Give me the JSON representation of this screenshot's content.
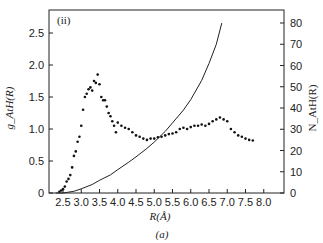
{
  "chart_data": {
    "type": "scatter",
    "panel_label": "(ii)",
    "caption": "(a)",
    "xlabel": "R(Å)",
    "ylabel_left": "g_AtH(R)",
    "ylabel_right": "N_AtH(R)",
    "xlim": [
      2.1,
      8.1
    ],
    "ylim_left": [
      0,
      2.85
    ],
    "ylim_right": [
      0,
      80
    ],
    "x_ticks": [
      "2.5",
      "3.0",
      "3.5",
      "4.0",
      "4.5",
      "5.0",
      "5.5",
      "6.0",
      "6.5",
      "7.0",
      "7.5",
      "8.0"
    ],
    "y_ticks_left": [
      "0",
      "0.5",
      "1.0",
      "1.5",
      "2.0",
      "2.5"
    ],
    "y_ticks_right": [
      "0",
      "10",
      "20",
      "30",
      "40",
      "50",
      "60",
      "70",
      "80"
    ],
    "series": [
      {
        "name": "g_AtH(R)",
        "style": "points",
        "axis": "left",
        "x": [
          2.4,
          2.45,
          2.5,
          2.55,
          2.6,
          2.65,
          2.7,
          2.75,
          2.8,
          2.85,
          2.9,
          2.95,
          3.0,
          3.05,
          3.1,
          3.15,
          3.2,
          3.25,
          3.3,
          3.35,
          3.4,
          3.45,
          3.5,
          3.55,
          3.6,
          3.65,
          3.7,
          3.75,
          3.8,
          3.85,
          3.9,
          3.95,
          4.0,
          4.1,
          4.2,
          4.3,
          4.4,
          4.5,
          4.6,
          4.7,
          4.8,
          4.9,
          5.0,
          5.1,
          5.2,
          5.3,
          5.4,
          5.5,
          5.6,
          5.7,
          5.8,
          5.9,
          6.0,
          6.1,
          6.2,
          6.3,
          6.4,
          6.5,
          6.6,
          6.7,
          6.8,
          6.9,
          7.0,
          7.1,
          7.2,
          7.3,
          7.4,
          7.5,
          7.6,
          7.7
        ],
        "y": [
          0.02,
          0.04,
          0.06,
          0.1,
          0.18,
          0.22,
          0.28,
          0.4,
          0.58,
          0.65,
          0.8,
          0.88,
          1.05,
          1.3,
          1.5,
          1.55,
          1.62,
          1.65,
          1.6,
          1.75,
          1.72,
          1.85,
          1.7,
          1.5,
          1.45,
          1.45,
          1.35,
          1.25,
          1.2,
          1.12,
          1.05,
          0.95,
          1.1,
          1.05,
          1.02,
          1.0,
          0.95,
          0.9,
          0.88,
          0.85,
          0.83,
          0.85,
          0.85,
          0.87,
          0.88,
          0.9,
          0.92,
          0.93,
          0.95,
          1.0,
          1.02,
          1.0,
          1.03,
          1.05,
          1.05,
          1.07,
          1.05,
          1.08,
          1.12,
          1.15,
          1.18,
          1.15,
          1.12,
          1.0,
          0.95,
          0.9,
          0.88,
          0.85,
          0.83,
          0.82
        ]
      },
      {
        "name": "N_AtH(R)",
        "style": "line",
        "axis": "right",
        "x": [
          2.3,
          2.5,
          2.8,
          3.0,
          3.3,
          3.5,
          3.8,
          4.0,
          4.3,
          4.5,
          4.8,
          5.0,
          5.3,
          5.5,
          5.8,
          6.0,
          6.3,
          6.5,
          6.7,
          6.85
        ],
        "y": [
          0,
          0,
          0.8,
          2,
          4,
          6,
          8.5,
          11,
          14.5,
          17,
          21,
          24,
          29,
          33,
          39,
          44,
          53,
          61,
          70,
          80
        ]
      }
    ]
  }
}
